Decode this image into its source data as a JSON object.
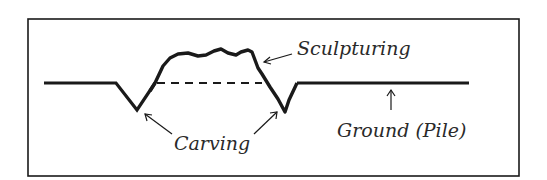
{
  "diagram": {
    "labels": {
      "sculpturing": "Sculpturing",
      "carving": "Carving",
      "ground": "Ground (Pile)"
    },
    "colors": {
      "ink": "#1a1a1a",
      "background": "#ffffff"
    },
    "elements": [
      "frame",
      "ground-line",
      "carved-grooves",
      "sculptured-mound",
      "original-surface-dashed-line",
      "annotation-arrows"
    ]
  }
}
